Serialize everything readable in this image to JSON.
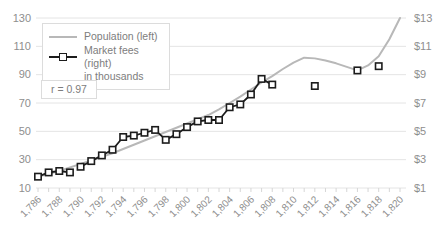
{
  "chart_data": {
    "type": "line",
    "title": "",
    "annotation": "r = 0.97",
    "legend_entries": [
      {
        "label": "Population (left)",
        "swatch": "gray-line"
      },
      {
        "label": "Market fees (right)",
        "label2": "in thousands",
        "swatch": "black-line-square-marker"
      }
    ],
    "left_axis": {
      "min": 10,
      "max": 130,
      "tick_values": [
        130,
        110,
        90,
        70,
        50,
        30,
        10
      ],
      "tick_labels": [
        "130",
        "110",
        "90",
        "70",
        "50",
        "30",
        "10"
      ]
    },
    "right_axis": {
      "min": 1,
      "max": 13,
      "tick_labels": [
        "$13",
        "$11",
        "$9",
        "$7",
        "$5",
        "$3",
        "$1"
      ]
    },
    "x_axis": {
      "min": 1786,
      "max": 1820,
      "ticks": [
        {
          "year": 1786,
          "label": "1,786"
        },
        {
          "year": 1788,
          "label": "1,788"
        },
        {
          "year": 1790,
          "label": "1,790"
        },
        {
          "year": 1792,
          "label": "1,792"
        },
        {
          "year": 1794,
          "label": "1,794"
        },
        {
          "year": 1796,
          "label": "1,796"
        },
        {
          "year": 1798,
          "label": "1,798"
        },
        {
          "year": 1800,
          "label": "1,800"
        },
        {
          "year": 1802,
          "label": "1,802"
        },
        {
          "year": 1804,
          "label": "1,804"
        },
        {
          "year": 1806,
          "label": "1,806"
        },
        {
          "year": 1808,
          "label": "1,808"
        },
        {
          "year": 1810,
          "label": "1,810"
        },
        {
          "year": 1812,
          "label": "1,812"
        },
        {
          "year": 1814,
          "label": "1,814"
        },
        {
          "year": 1816,
          "label": "1,816"
        },
        {
          "year": 1818,
          "label": "1,818"
        },
        {
          "year": 1820,
          "label": "1,820"
        }
      ]
    },
    "series": [
      {
        "name": "Population (left)",
        "axis": "left",
        "color": "#b8b8b8",
        "marker": "none",
        "start_year": 1786,
        "values": [
          18,
          20,
          22,
          24.5,
          27,
          29.5,
          32,
          34.5,
          37.5,
          40.5,
          43.5,
          46.5,
          49.5,
          52.5,
          55.5,
          58.5,
          61.5,
          65.5,
          70,
          74.5,
          79.5,
          84.5,
          89,
          94,
          98.5,
          102,
          101.5,
          100,
          98,
          95.5,
          93,
          96.5,
          103,
          115,
          130
        ]
      },
      {
        "name": "Market fees (right) in thousands",
        "axis": "right",
        "color": "#1c1c1c",
        "marker": "square",
        "segments": [
          {
            "start_year": 1786,
            "values": [
              1.8,
              2.1,
              2.2,
              2.1
            ]
          },
          {
            "start_year": 1790,
            "values": [
              2.5,
              2.9,
              3.3,
              3.7,
              4.6,
              4.7,
              4.9,
              5.1,
              4.4,
              4.8,
              5.3,
              5.7,
              5.8,
              5.8,
              6.7,
              6.9,
              7.6,
              8.7,
              8.3
            ]
          }
        ],
        "isolated_points": [
          {
            "year": 1812,
            "value": 8.2
          },
          {
            "year": 1816,
            "value": 9.3
          },
          {
            "year": 1818,
            "value": 9.6
          }
        ]
      }
    ],
    "style": {
      "gridline_color": "#e4e4e4",
      "minor_tick_color": "#d6d6d6",
      "axis_text_color": "#8e8e8e",
      "background": "#ffffff"
    }
  },
  "legend": {
    "population_label": "Population (left)",
    "market_fees_label": "Market fees (right)",
    "market_fees_label2": "in thousands"
  },
  "annotation": {
    "text": "r = 0.97"
  }
}
